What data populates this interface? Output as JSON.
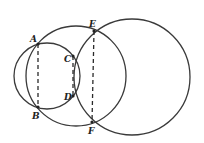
{
  "figure": {
    "width": 204,
    "height": 143,
    "stroke_color": "#3a3a3a",
    "background": "#ffffff",
    "circles": [
      {
        "id": "small",
        "cx": 47,
        "cy": 76,
        "r": 33
      },
      {
        "id": "middle",
        "cx": 76,
        "cy": 76,
        "r": 50
      },
      {
        "id": "large",
        "cx": 132,
        "cy": 77,
        "r": 58
      }
    ],
    "points": [
      {
        "label": "A",
        "x": 38,
        "y": 44,
        "lx": 31,
        "ly": 41
      },
      {
        "label": "B",
        "x": 38,
        "y": 107,
        "lx": 32,
        "ly": 119
      },
      {
        "label": "C",
        "x": 73,
        "y": 56,
        "lx": 64,
        "ly": 62
      },
      {
        "label": "D",
        "x": 73,
        "y": 96,
        "lx": 64,
        "ly": 100
      },
      {
        "label": "E",
        "x": 94,
        "y": 31,
        "lx": 90,
        "ly": 27
      },
      {
        "label": "F",
        "x": 92,
        "y": 122,
        "lx": 88,
        "ly": 134
      }
    ],
    "chords": [
      {
        "from": "A",
        "to": "B",
        "style": "dashed"
      },
      {
        "from": "C",
        "to": "D",
        "style": "dashed"
      },
      {
        "from": "E",
        "to": "F",
        "style": "dashed"
      }
    ],
    "labels": {
      "A": "A",
      "B": "B",
      "C": "C",
      "D": "D",
      "E": "E",
      "F": "F"
    }
  }
}
